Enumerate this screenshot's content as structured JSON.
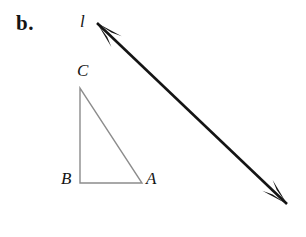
{
  "figure": {
    "part_label": "b.",
    "line_label": "l",
    "vertices": {
      "a": "A",
      "b": "B",
      "c": "C"
    },
    "colors": {
      "background": "#ffffff",
      "triangle_stroke": "#8c8c8c",
      "line_stroke": "#141414",
      "text": "#141414"
    },
    "geometry": {
      "triangle": {
        "points": [
          {
            "name": "C",
            "x": 80,
            "y": 88
          },
          {
            "name": "B",
            "x": 80,
            "y": 183
          },
          {
            "name": "A",
            "x": 142,
            "y": 183
          }
        ],
        "stroke_width": 1.4,
        "fill": "none"
      },
      "line_l": {
        "x1": 97,
        "y1": 23,
        "x2": 287,
        "y2": 204,
        "stroke_width": 2.6,
        "arrowheads": "both"
      }
    }
  }
}
